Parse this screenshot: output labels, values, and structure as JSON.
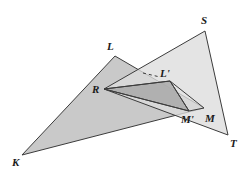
{
  "figure": {
    "type": "geometry-diagram",
    "background_color": "#ffffff",
    "stroke_color": "#3c3c3c",
    "colors": {
      "triangle_klm_fill": "#c9c9c9",
      "triangle_rst_fill": "#dcdcdc",
      "triangle_inner_fill": "#a9a9a9",
      "outline": "#3c3c3c",
      "label_color": "#1a1a1a"
    },
    "points": {
      "K": {
        "x": 22,
        "y": 155,
        "label": "K",
        "label_x": 12,
        "label_y": 157
      },
      "L": {
        "x": 115,
        "y": 56,
        "label": "L",
        "label_x": 107,
        "label_y": 41
      },
      "M": {
        "x": 204,
        "y": 108,
        "label": "M",
        "label_x": 205,
        "label_y": 113
      },
      "R": {
        "x": 104,
        "y": 89,
        "label": "R",
        "label_x": 92,
        "label_y": 84
      },
      "S": {
        "x": 205,
        "y": 31,
        "label": "S",
        "label_x": 201,
        "label_y": 15
      },
      "T": {
        "x": 228,
        "y": 135,
        "label": "T",
        "label_x": 230,
        "label_y": 138
      },
      "Lprime": {
        "x": 170,
        "y": 81,
        "label": "L'",
        "label_x": 160,
        "label_y": 68
      },
      "Mprime": {
        "x": 189,
        "y": 111,
        "label": "M'",
        "label_x": 181,
        "label_y": 114
      }
    },
    "shapes": [
      {
        "name": "triangle-klm",
        "vertices": "K,L,M",
        "fill": "#c9c9c9"
      },
      {
        "name": "triangle-rst",
        "vertices": "R,S,T",
        "fill": "#dcdcdc"
      },
      {
        "name": "triangle-r-lprime-mprime",
        "vertices": "R,L',M'",
        "fill": "#a9a9a9"
      }
    ],
    "dashed_segment": {
      "name": "dashed-guide-to-lprime",
      "from_x": 143,
      "from_y": 73,
      "to_x": 160,
      "to_y": 77
    },
    "labels": [
      "K",
      "L",
      "M",
      "R",
      "S",
      "T",
      "L'",
      "M'"
    ]
  }
}
